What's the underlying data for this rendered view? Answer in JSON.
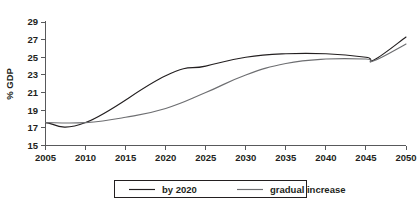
{
  "chart_data": {
    "type": "line",
    "title": "",
    "xlabel": "",
    "ylabel": "% GDP",
    "xlim": [
      2005,
      2050
    ],
    "ylim": [
      15,
      29
    ],
    "xticks": [
      2005,
      2010,
      2015,
      2020,
      2025,
      2030,
      2035,
      2040,
      2045,
      2050
    ],
    "xtick_labels": [
      "2005",
      "2010",
      "2015",
      "2020",
      "2025",
      "2030",
      "2035",
      "2040",
      "2045",
      "2050"
    ],
    "yticks": [
      15,
      17,
      19,
      21,
      23,
      25,
      27,
      29
    ],
    "ytick_labels": [
      "15",
      "17",
      "19",
      "21",
      "23",
      "25",
      "27",
      "29"
    ],
    "grid": false,
    "legend_position": "bottom",
    "series": [
      {
        "name": "by 2020",
        "color": "#231f20",
        "x": [
          2005,
          2010,
          2020,
          2025,
          2030,
          2035,
          2040,
          2045,
          2046,
          2050
        ],
        "values": [
          17.6,
          17.6,
          22.9,
          24.0,
          25.0,
          25.4,
          25.4,
          25.0,
          24.7,
          27.3
        ]
      },
      {
        "name": "gradual increase",
        "color": "#6d6e71",
        "x": [
          2005,
          2010,
          2015,
          2020,
          2025,
          2030,
          2035,
          2040,
          2045,
          2046,
          2050
        ],
        "values": [
          17.6,
          17.6,
          18.2,
          19.2,
          21.0,
          23.0,
          24.3,
          24.8,
          24.8,
          24.6,
          26.5
        ]
      }
    ]
  },
  "legend": {
    "entries": [
      {
        "label": "by 2020",
        "color": "#231f20"
      },
      {
        "label": "gradual increase",
        "color": "#6d6e71"
      }
    ]
  },
  "axes": {
    "y_axis_title": "% GDP"
  }
}
